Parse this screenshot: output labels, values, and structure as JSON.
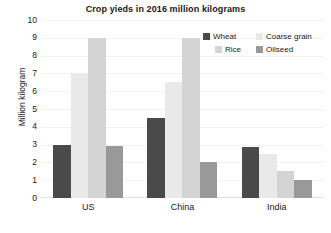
{
  "chart_data": {
    "type": "bar",
    "title": "Crop yieds in 2016 million kilograms",
    "xlabel": "",
    "ylabel": "Million kilogram",
    "categories": [
      "US",
      "China",
      "India"
    ],
    "series": [
      {
        "name": "Wheat",
        "color": "#4a4a4a",
        "values": [
          3,
          4.5,
          2.85
        ]
      },
      {
        "name": "Coarse grain",
        "color": "#e9e9e9",
        "values": [
          7,
          6.5,
          2.5
        ]
      },
      {
        "name": "Rice",
        "color": "#d4d4d4",
        "values": [
          9,
          9,
          1.5
        ]
      },
      {
        "name": "Oilseed",
        "color": "#999999",
        "values": [
          2.9,
          2,
          1
        ]
      }
    ],
    "ylim": [
      0,
      10
    ],
    "yticks": [
      "0",
      "1",
      "2",
      "3",
      "4",
      "5",
      "6",
      "7",
      "8",
      "9",
      "10"
    ],
    "grid": true,
    "legend_position": "top-right"
  },
  "legend": {
    "entries": [
      {
        "label": "Wheat"
      },
      {
        "label": "Coarse grain"
      },
      {
        "label": "Rice"
      },
      {
        "label": "Oilseed"
      }
    ]
  }
}
